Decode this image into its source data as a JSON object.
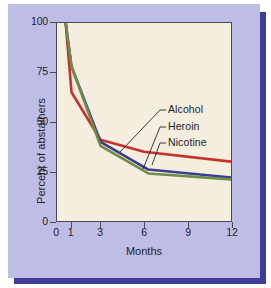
{
  "chart_data": {
    "type": "line",
    "title": "",
    "xlabel": "Months",
    "ylabel": "Percent of abstainers",
    "xlim": [
      0,
      12
    ],
    "ylim": [
      0,
      100
    ],
    "xticks": [
      0,
      1,
      3,
      6,
      9,
      12
    ],
    "xtick_labels": [
      "0",
      "1",
      "3",
      "6",
      "9",
      "12"
    ],
    "yticks": [
      0,
      25,
      50,
      75,
      100
    ],
    "ytick_labels": [
      "0",
      "25",
      "50",
      "75",
      "100"
    ],
    "grid": false,
    "legend_position": "inline-annotation",
    "series": [
      {
        "name": "Alcohol",
        "color": "#c4332b",
        "x": [
          0.6,
          1,
          3,
          6,
          12
        ],
        "values": [
          100,
          65,
          41,
          35,
          30
        ]
      },
      {
        "name": "Heroin",
        "color": "#3b3b8f",
        "x": [
          0.6,
          1,
          3,
          6.3,
          12
        ],
        "values": [
          100,
          78,
          40,
          26,
          22
        ]
      },
      {
        "name": "Nicotine",
        "color": "#6e8c4a",
        "x": [
          0.6,
          1,
          3,
          6.3,
          12
        ],
        "values": [
          100,
          78,
          38,
          24,
          21
        ]
      }
    ],
    "annotations": [
      {
        "label": "Alcohol",
        "text_x": 168,
        "text_y": 110,
        "leader_to_x": 120,
        "leader_to_y": 152
      },
      {
        "label": "Heroin",
        "text_x": 168,
        "text_y": 127,
        "leader_to_x": 143,
        "leader_to_y": 169
      },
      {
        "label": "Nicotine",
        "text_x": 168,
        "text_y": 143,
        "leader_to_x": 152,
        "leader_to_y": 165
      }
    ]
  },
  "colors": {
    "panel": "#bdbde6",
    "shadow": "#3d3d96",
    "plot_background": "#f5eede",
    "axis": "#4a4a52",
    "text": "#23232b",
    "alcohol": "#c4332b",
    "heroin": "#3b3b8f",
    "nicotine": "#6e8c4a"
  }
}
